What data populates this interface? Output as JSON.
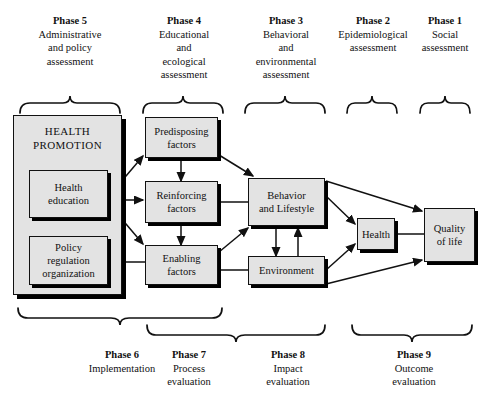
{
  "diagram": {
    "colors": {
      "box_fill": "#e3e3e3",
      "box_border": "#111111",
      "shadow": "#000000",
      "text": "#111111",
      "background": "#ffffff"
    }
  },
  "top_phases": [
    {
      "title": "Phase 5",
      "lines": [
        "Administrative",
        "and policy",
        "assessment"
      ]
    },
    {
      "title": "Phase 4",
      "lines": [
        "Educational",
        "and",
        "ecological",
        "assessment"
      ]
    },
    {
      "title": "Phase 3",
      "lines": [
        "Behavioral",
        "and",
        "environmental",
        "assessment"
      ]
    },
    {
      "title": "Phase 2",
      "lines": [
        "Epidemiological",
        "assessment"
      ]
    },
    {
      "title": "Phase 1",
      "lines": [
        "Social",
        "assessment"
      ]
    }
  ],
  "bottom_phases": [
    {
      "title": "Phase 6",
      "lines": [
        "Implementation"
      ]
    },
    {
      "title": "Phase 7",
      "lines": [
        "Process",
        "evaluation"
      ]
    },
    {
      "title": "Phase 8",
      "lines": [
        "Impact",
        "evaluation"
      ]
    },
    {
      "title": "Phase 9",
      "lines": [
        "Outcome",
        "evaluation"
      ]
    }
  ],
  "nodes": {
    "health_promotion": {
      "lines": [
        "HEALTH",
        "PROMOTION"
      ]
    },
    "health_education": {
      "lines": [
        "Health",
        "education"
      ]
    },
    "policy": {
      "lines": [
        "Policy",
        "regulation",
        "organization"
      ]
    },
    "predisposing": {
      "lines": [
        "Predisposing",
        "factors"
      ]
    },
    "reinforcing": {
      "lines": [
        "Reinforcing",
        "factors"
      ]
    },
    "enabling": {
      "lines": [
        "Enabling",
        "factors"
      ]
    },
    "behavior": {
      "lines": [
        "Behavior",
        "and Lifestyle"
      ]
    },
    "environment": {
      "lines": [
        "Environment"
      ]
    },
    "health": {
      "lines": [
        "Health"
      ]
    },
    "quality_of_life": {
      "lines": [
        "Quality",
        "of life"
      ]
    }
  }
}
